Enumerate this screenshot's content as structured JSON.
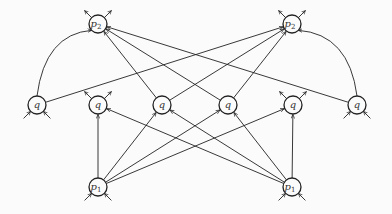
{
  "diagram": {
    "type": "directed-graph",
    "node_radius": 9,
    "colors": {
      "stroke": "#222222",
      "background": "#fbfbfb",
      "label": "#333333"
    },
    "nodes": [
      {
        "id": "p2L",
        "label": "p",
        "sub": "2",
        "x": 98,
        "y": 24,
        "stubs": "out-up"
      },
      {
        "id": "p2R",
        "label": "p",
        "sub": "2",
        "x": 292,
        "y": 24,
        "stubs": "out-up"
      },
      {
        "id": "q1",
        "label": "q",
        "sub": "",
        "x": 37,
        "y": 105,
        "stubs": "in-down"
      },
      {
        "id": "q2",
        "label": "q",
        "sub": "",
        "x": 98,
        "y": 105,
        "stubs": "out-up"
      },
      {
        "id": "q3",
        "label": "q",
        "sub": "",
        "x": 162,
        "y": 105,
        "stubs": "none"
      },
      {
        "id": "q4",
        "label": "q",
        "sub": "",
        "x": 228,
        "y": 105,
        "stubs": "none"
      },
      {
        "id": "q5",
        "label": "q",
        "sub": "",
        "x": 293,
        "y": 105,
        "stubs": "out-up"
      },
      {
        "id": "q6",
        "label": "q",
        "sub": "",
        "x": 357,
        "y": 105,
        "stubs": "in-down"
      },
      {
        "id": "p1L",
        "label": "p",
        "sub": "1",
        "x": 98,
        "y": 187,
        "stubs": "in-down"
      },
      {
        "id": "p1R",
        "label": "p",
        "sub": "1",
        "x": 292,
        "y": 187,
        "stubs": "in-down"
      }
    ],
    "edges": [
      {
        "from": "q1",
        "to": "p2L",
        "curve": "arc-left"
      },
      {
        "from": "q3",
        "to": "p2L",
        "curve": "straight"
      },
      {
        "from": "q4",
        "to": "p2L",
        "curve": "straight"
      },
      {
        "from": "q6",
        "to": "p2L",
        "curve": "straight"
      },
      {
        "from": "q6",
        "to": "p2R",
        "curve": "arc-right"
      },
      {
        "from": "q1",
        "to": "p2R",
        "curve": "straight"
      },
      {
        "from": "q3",
        "to": "p2R",
        "curve": "straight"
      },
      {
        "from": "q4",
        "to": "p2R",
        "curve": "straight"
      },
      {
        "from": "p1L",
        "to": "q2",
        "curve": "straight"
      },
      {
        "from": "p1L",
        "to": "q4",
        "curve": "straight"
      },
      {
        "from": "p1L",
        "to": "q5",
        "curve": "straight"
      },
      {
        "from": "p1L",
        "to": "q3",
        "curve": "straight"
      },
      {
        "from": "p1R",
        "to": "q5",
        "curve": "straight"
      },
      {
        "from": "p1R",
        "to": "q2",
        "curve": "straight"
      },
      {
        "from": "p1R",
        "to": "q3",
        "curve": "straight"
      },
      {
        "from": "p1R",
        "to": "q4",
        "curve": "straight"
      }
    ]
  }
}
